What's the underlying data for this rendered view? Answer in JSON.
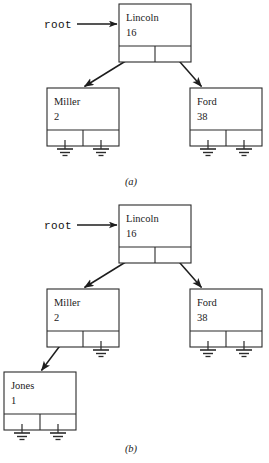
{
  "figure": {
    "width": 269,
    "height": 463,
    "background_color": "#ffffff",
    "line_color": "#1d1d1d",
    "box_stroke_color": "#2b2b2b",
    "text_color": "#1a1a1a",
    "root_pointer_label": "root",
    "panels": [
      {
        "id": "panel-a",
        "caption": "(a)",
        "caption_x": 131,
        "caption_y": 185,
        "root_label_x": 44,
        "root_label_y": 28,
        "root_arrow": {
          "x1": 77,
          "y1": 24,
          "x2": 117,
          "y2": 24
        },
        "nodes": [
          {
            "id": "lincoln-a",
            "name": "Lincoln",
            "value": "16",
            "x": 119,
            "y": 4,
            "width": 72,
            "height": 58,
            "split_y": 42,
            "left_child": "miller-a",
            "right_child": "ford-a",
            "left_ground": false,
            "right_ground": false
          },
          {
            "id": "miller-a",
            "name": "Miller",
            "value": "2",
            "x": 47,
            "y": 88,
            "width": 72,
            "height": 58,
            "split_y": 42,
            "left_child": null,
            "right_child": null,
            "left_ground": true,
            "right_ground": true
          },
          {
            "id": "ford-a",
            "name": "Ford",
            "value": "38",
            "x": 190,
            "y": 88,
            "width": 72,
            "height": 58,
            "split_y": 42,
            "left_child": null,
            "right_child": null,
            "left_ground": true,
            "right_ground": true
          }
        ]
      },
      {
        "id": "panel-b",
        "caption": "(b)",
        "caption_x": 131,
        "caption_y": 452,
        "root_label_x": 44,
        "root_label_y": 229,
        "root_arrow": {
          "x1": 77,
          "y1": 225,
          "x2": 117,
          "y2": 225
        },
        "nodes": [
          {
            "id": "lincoln-b",
            "name": "Lincoln",
            "value": "16",
            "x": 119,
            "y": 205,
            "width": 72,
            "height": 58,
            "split_y": 42,
            "left_child": "miller-b",
            "right_child": "ford-b",
            "left_ground": false,
            "right_ground": false
          },
          {
            "id": "miller-b",
            "name": "Miller",
            "value": "2",
            "x": 47,
            "y": 289,
            "width": 72,
            "height": 58,
            "split_y": 42,
            "left_child": "jones-b",
            "right_child": null,
            "left_ground": false,
            "right_ground": true
          },
          {
            "id": "ford-b",
            "name": "Ford",
            "value": "38",
            "x": 190,
            "y": 289,
            "width": 72,
            "height": 58,
            "split_y": 42,
            "left_child": null,
            "right_child": null,
            "left_ground": true,
            "right_ground": true
          },
          {
            "id": "jones-b",
            "name": "Jones",
            "value": "1",
            "x": 4,
            "y": 372,
            "width": 72,
            "height": 58,
            "split_y": 42,
            "left_child": null,
            "right_child": null,
            "left_ground": true,
            "right_ground": true
          }
        ]
      }
    ]
  },
  "chart_data": {
    "type": "diagram",
    "diagram_kind": "binary-search-tree-linked-structure",
    "variants": [
      {
        "label": "(a)",
        "description": "Tree with root Lincoln and two leaf children",
        "root": "Lincoln",
        "nodes": [
          {
            "name": "Lincoln",
            "value": 16,
            "left": "Miller",
            "right": "Ford"
          },
          {
            "name": "Miller",
            "value": 2,
            "left": null,
            "right": null
          },
          {
            "name": "Ford",
            "value": 38,
            "left": null,
            "right": null
          }
        ]
      },
      {
        "label": "(b)",
        "description": "Tree after inserting Jones as Miller's left child",
        "root": "Lincoln",
        "nodes": [
          {
            "name": "Lincoln",
            "value": 16,
            "left": "Miller",
            "right": "Ford"
          },
          {
            "name": "Miller",
            "value": 2,
            "left": "Jones",
            "right": null
          },
          {
            "name": "Ford",
            "value": 38,
            "left": null,
            "right": null
          },
          {
            "name": "Jones",
            "value": 1,
            "left": null,
            "right": null
          }
        ]
      }
    ],
    "legend": [
      "root pointer arrow",
      "null pointer shown as ground symbol"
    ]
  }
}
